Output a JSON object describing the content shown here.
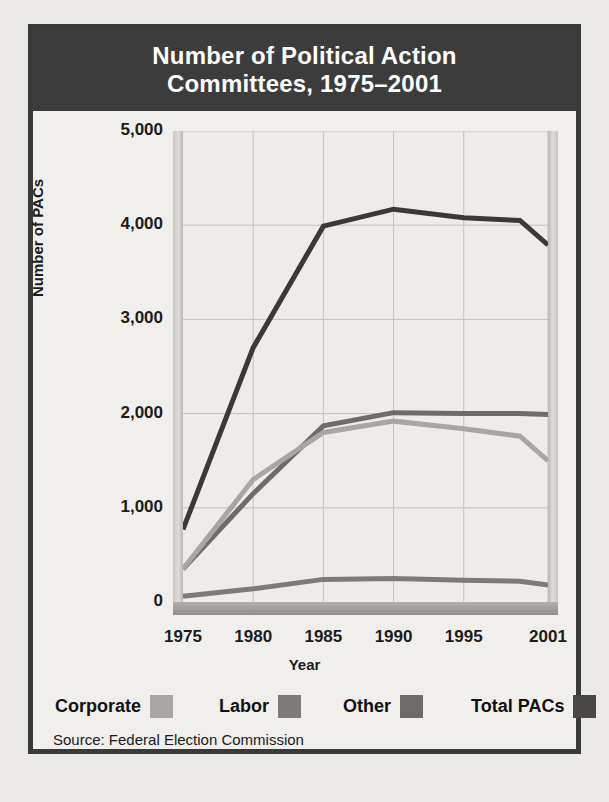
{
  "title": {
    "line1": "Number of Political Action",
    "line2": "Committees, 1975–2001"
  },
  "source": "Source: Federal Election Commission",
  "legend": {
    "items": [
      {
        "label": "Corporate",
        "color": "#a8a6a2"
      },
      {
        "label": "Labor",
        "color": "#7d7b77"
      },
      {
        "label": "Other",
        "color": "#6e6c68"
      },
      {
        "label": "Total PACs",
        "color": "#4a4845"
      }
    ]
  },
  "chart_data": {
    "type": "line",
    "title": "Number of Political Action Committees, 1975–2001",
    "xlabel": "Year",
    "ylabel": "Number of PACs",
    "xlim": [
      1975,
      2001
    ],
    "ylim": [
      0,
      5000
    ],
    "xticks": [
      1975,
      1980,
      1985,
      1990,
      1995,
      2001
    ],
    "xtick_labels": [
      "1975",
      "1980",
      "1985",
      "1990",
      "1995",
      "2001"
    ],
    "yticks": [
      0,
      1000,
      2000,
      3000,
      4000,
      5000
    ],
    "ytick_labels": [
      "0",
      "1,000",
      "2,000",
      "3,000",
      "4,000",
      "5,000"
    ],
    "grid": true,
    "legend_position": "below",
    "x": [
      1975,
      1980,
      1985,
      1990,
      1995,
      1999,
      2001
    ],
    "series": [
      {
        "name": "Total PACs",
        "color": "#3b3936",
        "width": 5,
        "values": [
          770,
          2700,
          3990,
          4170,
          4080,
          4050,
          3790
        ]
      },
      {
        "name": "Other",
        "color": "#6e6c68",
        "width": 5,
        "values": [
          350,
          1150,
          1870,
          2010,
          2000,
          2000,
          1990
        ]
      },
      {
        "name": "Corporate",
        "color": "#a8a6a2",
        "width": 5,
        "values": [
          350,
          1300,
          1800,
          1920,
          1840,
          1760,
          1500
        ]
      },
      {
        "name": "Labor",
        "color": "#7d7b77",
        "width": 5,
        "values": [
          60,
          140,
          240,
          250,
          230,
          220,
          180
        ]
      }
    ]
  }
}
